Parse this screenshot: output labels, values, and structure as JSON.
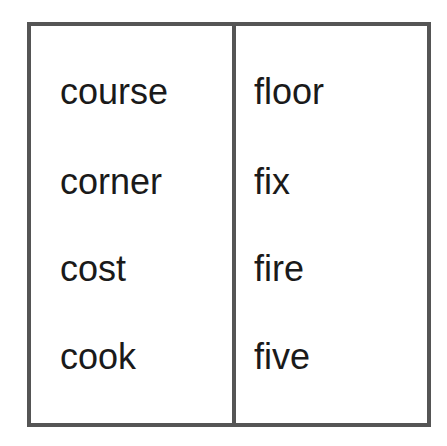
{
  "word_table": {
    "columns": [
      {
        "words": [
          "course",
          "corner",
          "cost",
          "cook"
        ]
      },
      {
        "words": [
          "floor",
          "fix",
          "fire",
          "five"
        ]
      }
    ],
    "border_color": "#555555",
    "text_color": "#1a1a1a"
  }
}
